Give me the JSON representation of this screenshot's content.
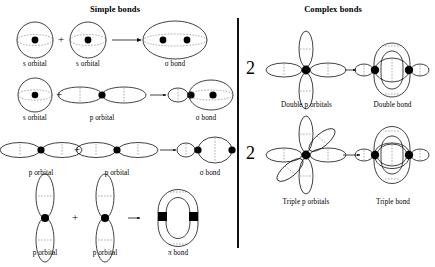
{
  "figure": {
    "type": "diagram",
    "panels": [
      {
        "id": "simple",
        "title": "Simple bonds",
        "title_x": 115,
        "title_y": 10,
        "rows": [
          {
            "id": "s-plus-s",
            "terms": [
              {
                "kind": "s-orbital",
                "label": "s orbital",
                "cx": 35,
                "cy": 40,
                "r": 18
              },
              {
                "kind": "plus",
                "x": 61,
                "y": 44
              },
              {
                "kind": "s-orbital",
                "label": "s orbital",
                "cx": 88,
                "cy": 40,
                "r": 18
              },
              {
                "kind": "arrow",
                "x1": 110,
                "y1": 40,
                "x2": 145,
                "y2": 40
              },
              {
                "kind": "sigma-ss",
                "label": "σ bond",
                "cx": 175,
                "cy": 40,
                "rx": 32,
                "ry": 19
              }
            ]
          },
          {
            "id": "s-plus-p",
            "terms": [
              {
                "kind": "s-orbital",
                "label": "s orbital",
                "cx": 35,
                "cy": 95,
                "r": 17
              },
              {
                "kind": "plus",
                "x": 59,
                "y": 99
              },
              {
                "kind": "p-orbital-h",
                "label": "p orbital",
                "cx": 102,
                "cy": 95,
                "lobe_rx": 22,
                "lobe_ry": 8
              },
              {
                "kind": "arrow",
                "x1": 134,
                "y1": 95,
                "x2": 163,
                "y2": 95
              },
              {
                "kind": "sigma-sp",
                "label": "σ bond",
                "cx": 192,
                "cy": 95
              }
            ]
          },
          {
            "id": "p-plus-p",
            "terms": [
              {
                "kind": "p-orbital-h",
                "label": "p orbital",
                "cx": 42,
                "cy": 150,
                "lobe_rx": 22,
                "lobe_ry": 8
              },
              {
                "kind": "plus",
                "x": 76,
                "y": 154
              },
              {
                "kind": "p-orbital-h",
                "label": "p orbital",
                "cx": 117,
                "cy": 150,
                "lobe_rx": 22,
                "lobe_ry": 8
              },
              {
                "kind": "arrow",
                "x1": 148,
                "y1": 150,
                "x2": 172,
                "y2": 150
              },
              {
                "kind": "sigma-pp",
                "label": "σ bond",
                "cx": 200,
                "cy": 150
              }
            ]
          },
          {
            "id": "pi-bond",
            "terms": [
              {
                "kind": "p-orbital-v",
                "label": "p orbital",
                "cx": 45,
                "cy": 218,
                "lobe_rx": 9,
                "lobe_ry": 25
              },
              {
                "kind": "plus",
                "x": 75,
                "y": 222
              },
              {
                "kind": "p-orbital-v",
                "label": "p orbital",
                "cx": 105,
                "cy": 218,
                "lobe_rx": 9,
                "lobe_ry": 25
              },
              {
                "kind": "arrow",
                "x1": 126,
                "y1": 218,
                "x2": 142,
                "y2": 218
              },
              {
                "kind": "pi-cloud",
                "label": "π bond",
                "cx": 178,
                "cy": 218
              }
            ]
          }
        ]
      },
      {
        "id": "complex",
        "title": "Complex bonds",
        "title_x": 333,
        "title_y": 10,
        "rows": [
          {
            "id": "double",
            "coefficient": "2",
            "coef_x": 249,
            "coef_y": 63,
            "terms": [
              {
                "kind": "double-p-orbitals",
                "label": "Double p orbitals",
                "cx": 306,
                "cy": 70
              },
              {
                "kind": "arrow",
                "x1": 345,
                "y1": 70,
                "x2": 356,
                "y2": 70
              },
              {
                "kind": "double-bond",
                "label": "Double bond",
                "cx": 392,
                "cy": 70
              }
            ]
          },
          {
            "id": "triple",
            "coefficient": "2",
            "coef_x": 249,
            "coef_y": 148,
            "terms": [
              {
                "kind": "triple-p-orbitals",
                "label": "Triple p orbitals",
                "cx": 306,
                "cy": 155
              },
              {
                "kind": "arrow",
                "x1": 343,
                "y1": 155,
                "x2": 362,
                "y2": 155
              },
              {
                "kind": "triple-bond",
                "label": "Triple bond",
                "cx": 392,
                "cy": 155
              }
            ]
          }
        ]
      }
    ],
    "divider": {
      "x": 237,
      "y": 18,
      "height": 230
    },
    "labels": {
      "s_orbital": "s orbital",
      "p_orbital": "p orbital",
      "sigma_bond": "σ bond",
      "pi_bond": "π bond",
      "double_p_orbitals": "Double p orbitals",
      "double_bond": "Double bond",
      "triple_p_orbitals": "Triple p orbitals",
      "triple_bond": "Triple bond",
      "plus": "+",
      "two": "2"
    },
    "colors": {
      "stroke": "#111111",
      "nucleus": "#000000",
      "dashed": "#666666",
      "background": "#ffffff"
    }
  }
}
